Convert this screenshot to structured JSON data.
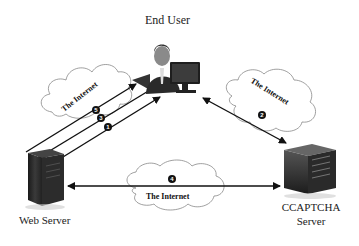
{
  "diagram": {
    "nodes": {
      "end_user": {
        "label": "End User"
      },
      "web_server": {
        "label": "Web Server"
      },
      "ccaptcha_server": {
        "label_line1": "CCAPTCHA",
        "label_line2": "Server"
      }
    },
    "clouds": {
      "left": {
        "label": "The Internet"
      },
      "right": {
        "label": "The Internet"
      },
      "bottom": {
        "label": "The Internet"
      }
    },
    "steps": [
      {
        "num": "1",
        "from": "Web Server",
        "to": "End User"
      },
      {
        "num": "2",
        "from": "End User",
        "to": "CCAPTCHA Server"
      },
      {
        "num": "3",
        "from": "End User",
        "to": "Web Server"
      },
      {
        "num": "4",
        "from": "Web Server",
        "to": "CCAPTCHA Server"
      },
      {
        "num": "5",
        "from": "Web Server",
        "to": "End User"
      }
    ]
  }
}
